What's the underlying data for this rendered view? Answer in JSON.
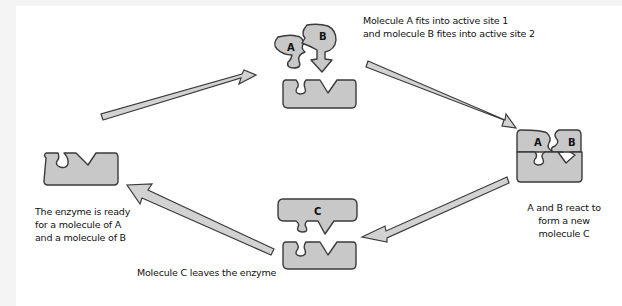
{
  "diagram": {
    "type": "enzyme-reaction-cycle",
    "stages": [
      {
        "id": "ready",
        "caption_lines": [
          "The enzyme is ready",
          "for a molecule of A",
          "and a molecule of B"
        ]
      },
      {
        "id": "binding",
        "molecule_labels": [
          "A",
          "B"
        ],
        "caption_lines": [
          "Molecule A fits into active site 1",
          "and molecule B fites into active site 2"
        ]
      },
      {
        "id": "reaction",
        "molecule_labels": [
          "A",
          "B"
        ],
        "caption_lines": [
          "A and B react to",
          "form a new",
          "molecule C"
        ]
      },
      {
        "id": "release",
        "molecule_labels": [
          "C"
        ],
        "caption_lines": [
          "Molecule C leaves the enzyme"
        ]
      }
    ],
    "arrows": [
      {
        "from": "ready",
        "to": "binding"
      },
      {
        "from": "binding",
        "to": "reaction"
      },
      {
        "from": "reaction",
        "to": "release"
      },
      {
        "from": "release",
        "to": "ready"
      }
    ],
    "colors": {
      "shape_fill": "#c8c8c8",
      "arrow_fill": "#d2d2d2",
      "outline": "#3a3a3a",
      "background": "#ffffff"
    }
  }
}
